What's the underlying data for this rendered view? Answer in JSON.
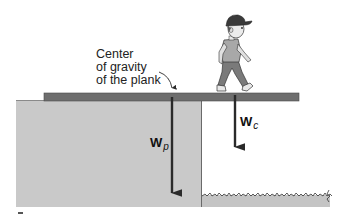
{
  "figure": {
    "annotation": {
      "line1": "Center",
      "line2": "of gravity",
      "line3": "of the plank"
    },
    "forces": [
      {
        "symbol": "W",
        "subscript": "p",
        "meaning": "weight of plank"
      },
      {
        "symbol": "W",
        "subscript": "c",
        "meaning": "weight of child"
      }
    ]
  },
  "colors": {
    "plank": "#6e6e6e",
    "cliff": "#c9c9c9",
    "ground": "#c4c4c4",
    "arrow": "#2a2a2a",
    "text": "#222222"
  }
}
